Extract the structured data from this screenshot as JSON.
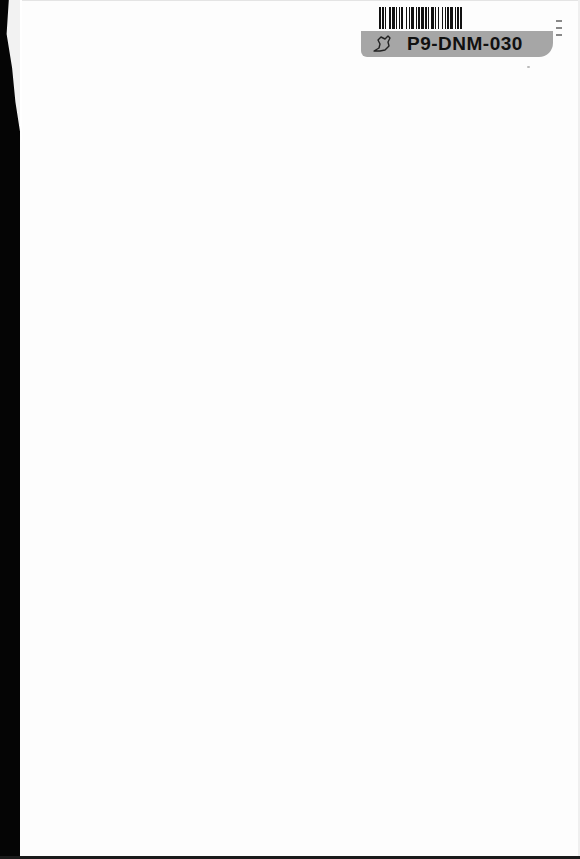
{
  "page": {
    "type": "scanned-blank-book-page",
    "background_color": "#fdfdfd",
    "binding_edge_color": "#050505"
  },
  "sticker": {
    "barcode_label": "P9-DNM-030",
    "icon": "leaf-outline-icon",
    "band_color": "#a6a6a6",
    "barcode_bars": [
      2,
      1,
      2,
      1,
      1,
      3,
      2,
      1,
      3,
      1,
      1,
      2,
      1,
      1,
      2,
      3,
      1,
      2,
      1,
      1,
      3,
      2,
      1,
      1,
      2,
      1,
      3,
      1,
      2,
      1,
      1,
      2,
      3,
      1,
      1,
      2,
      1,
      3,
      1,
      2,
      1,
      1,
      2,
      1,
      3,
      2,
      1,
      1,
      2,
      1,
      2
    ]
  }
}
